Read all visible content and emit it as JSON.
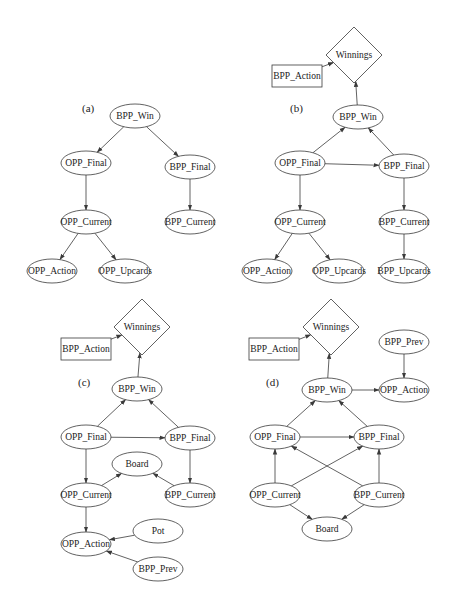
{
  "diagram": {
    "title": "",
    "panels": [
      {
        "label": "(a)",
        "label_pos": [
          82,
          112
        ],
        "nodes": [
          {
            "id": "BPP_Win",
            "label": "BPP_Win",
            "shape": "ellipse",
            "x": 135,
            "y": 116
          },
          {
            "id": "OPP_Final",
            "label": "OPP_Final",
            "shape": "ellipse",
            "x": 86,
            "y": 163
          },
          {
            "id": "BPP_Final",
            "label": "BPP_Final",
            "shape": "ellipse",
            "x": 190,
            "y": 167
          },
          {
            "id": "OPP_Current",
            "label": "OPP_Current",
            "shape": "ellipse",
            "x": 86,
            "y": 222
          },
          {
            "id": "BPP_Current",
            "label": "BPP_Current",
            "shape": "ellipse",
            "x": 190,
            "y": 222
          },
          {
            "id": "OPP_Action",
            "label": "OPP_Action",
            "shape": "ellipse",
            "x": 52,
            "y": 271
          },
          {
            "id": "OPP_Upcards",
            "label": "OPP_Upcards",
            "shape": "ellipse",
            "x": 125,
            "y": 271
          }
        ],
        "edges": [
          [
            "BPP_Win",
            "OPP_Final"
          ],
          [
            "BPP_Win",
            "BPP_Final"
          ],
          [
            "OPP_Final",
            "OPP_Current"
          ],
          [
            "BPP_Final",
            "BPP_Current"
          ],
          [
            "OPP_Current",
            "OPP_Action"
          ],
          [
            "OPP_Current",
            "OPP_Upcards"
          ]
        ]
      },
      {
        "label": "(b)",
        "label_pos": [
          290,
          112
        ],
        "nodes": [
          {
            "id": "Winnings",
            "label": "Winnings",
            "shape": "diamond",
            "x": 354,
            "y": 55
          },
          {
            "id": "BPP_Action",
            "label": "BPP_Action",
            "shape": "rect",
            "x": 297,
            "y": 76
          },
          {
            "id": "BPP_Win",
            "label": "BPP_Win",
            "shape": "ellipse",
            "x": 358,
            "y": 117
          },
          {
            "id": "OPP_Final",
            "label": "OPP_Final",
            "shape": "ellipse",
            "x": 300,
            "y": 163
          },
          {
            "id": "BPP_Final",
            "label": "BPP_Final",
            "shape": "ellipse",
            "x": 404,
            "y": 166
          },
          {
            "id": "OPP_Current",
            "label": "OPP_Current",
            "shape": "ellipse",
            "x": 300,
            "y": 222
          },
          {
            "id": "BPP_Current",
            "label": "BPP_Current",
            "shape": "ellipse",
            "x": 404,
            "y": 222
          },
          {
            "id": "OPP_Action",
            "label": "OPP_Action",
            "shape": "ellipse",
            "x": 267,
            "y": 271
          },
          {
            "id": "OPP_Upcards",
            "label": "OPP_Upcards",
            "shape": "ellipse",
            "x": 339,
            "y": 271
          },
          {
            "id": "BPP_Upcards",
            "label": "BPP_Upcards",
            "shape": "ellipse",
            "x": 404,
            "y": 271
          }
        ],
        "edges": [
          [
            "BPP_Action",
            "Winnings"
          ],
          [
            "BPP_Win",
            "Winnings"
          ],
          [
            "OPP_Final",
            "BPP_Win"
          ],
          [
            "BPP_Final",
            "BPP_Win"
          ],
          [
            "OPP_Final",
            "BPP_Final"
          ],
          [
            "OPP_Final",
            "OPP_Current"
          ],
          [
            "BPP_Final",
            "BPP_Current"
          ],
          [
            "OPP_Current",
            "OPP_Action"
          ],
          [
            "OPP_Current",
            "OPP_Upcards"
          ],
          [
            "BPP_Current",
            "BPP_Upcards"
          ]
        ]
      },
      {
        "label": "(c)",
        "label_pos": [
          78,
          386
        ],
        "nodes": [
          {
            "id": "Winnings",
            "label": "Winnings",
            "shape": "diamond",
            "x": 142,
            "y": 327
          },
          {
            "id": "BPP_Action",
            "label": "BPP_Action",
            "shape": "rect",
            "x": 86,
            "y": 349
          },
          {
            "id": "BPP_Win",
            "label": "BPP_Win",
            "shape": "ellipse",
            "x": 137,
            "y": 389
          },
          {
            "id": "OPP_Final",
            "label": "OPP_Final",
            "shape": "ellipse",
            "x": 86,
            "y": 437
          },
          {
            "id": "BPP_Final",
            "label": "BPP_Final",
            "shape": "ellipse",
            "x": 190,
            "y": 438
          },
          {
            "id": "Board",
            "label": "Board",
            "shape": "ellipse",
            "x": 137,
            "y": 464
          },
          {
            "id": "OPP_Current",
            "label": "OPP_Current",
            "shape": "ellipse",
            "x": 86,
            "y": 495
          },
          {
            "id": "BPP_Current",
            "label": "BPP_Current",
            "shape": "ellipse",
            "x": 190,
            "y": 495
          },
          {
            "id": "OPP_Action",
            "label": "OPP_Action",
            "shape": "ellipse",
            "x": 86,
            "y": 544
          },
          {
            "id": "Pot",
            "label": "Pot",
            "shape": "ellipse",
            "x": 158,
            "y": 531
          },
          {
            "id": "BPP_Prev",
            "label": "BPP_Prev",
            "shape": "ellipse",
            "x": 158,
            "y": 569
          }
        ],
        "edges": [
          [
            "BPP_Action",
            "Winnings"
          ],
          [
            "BPP_Win",
            "Winnings"
          ],
          [
            "OPP_Final",
            "BPP_Win"
          ],
          [
            "BPP_Final",
            "BPP_Win"
          ],
          [
            "OPP_Final",
            "BPP_Final"
          ],
          [
            "OPP_Final",
            "OPP_Current"
          ],
          [
            "BPP_Final",
            "BPP_Current"
          ],
          [
            "OPP_Current",
            "Board"
          ],
          [
            "BPP_Current",
            "Board"
          ],
          [
            "OPP_Current",
            "OPP_Action"
          ],
          [
            "Pot",
            "OPP_Action"
          ],
          [
            "BPP_Prev",
            "OPP_Action"
          ]
        ]
      },
      {
        "label": "(d)",
        "label_pos": [
          266,
          386
        ],
        "nodes": [
          {
            "id": "Winnings",
            "label": "Winnings",
            "shape": "diamond",
            "x": 331,
            "y": 327
          },
          {
            "id": "BPP_Action",
            "label": "BPP_Action",
            "shape": "rect",
            "x": 274,
            "y": 349
          },
          {
            "id": "BPP_Prev",
            "label": "BPP_Prev",
            "shape": "ellipse",
            "x": 404,
            "y": 342
          },
          {
            "id": "BPP_Win",
            "label": "BPP_Win",
            "shape": "ellipse",
            "x": 327,
            "y": 390
          },
          {
            "id": "OPP_Action",
            "label": "OPP_Action",
            "shape": "ellipse",
            "x": 404,
            "y": 390
          },
          {
            "id": "OPP_Final",
            "label": "OPP_Final",
            "shape": "ellipse",
            "x": 275,
            "y": 437
          },
          {
            "id": "BPP_Final",
            "label": "BPP_Final",
            "shape": "ellipse",
            "x": 379,
            "y": 437
          },
          {
            "id": "OPP_Current",
            "label": "OPP_Current",
            "shape": "ellipse",
            "x": 275,
            "y": 495
          },
          {
            "id": "BPP_Current",
            "label": "BPP_Current",
            "shape": "ellipse",
            "x": 379,
            "y": 495
          },
          {
            "id": "Board",
            "label": "Board",
            "shape": "ellipse",
            "x": 327,
            "y": 529
          }
        ],
        "edges": [
          [
            "BPP_Action",
            "Winnings"
          ],
          [
            "BPP_Win",
            "Winnings"
          ],
          [
            "BPP_Prev",
            "OPP_Action"
          ],
          [
            "BPP_Win",
            "OPP_Action"
          ],
          [
            "OPP_Final",
            "BPP_Win"
          ],
          [
            "BPP_Final",
            "BPP_Win"
          ],
          [
            "OPP_Final",
            "BPP_Final"
          ],
          [
            "OPP_Current",
            "OPP_Final"
          ],
          [
            "BPP_Current",
            "BPP_Final"
          ],
          [
            "OPP_Current",
            "BPP_Final"
          ],
          [
            "BPP_Current",
            "OPP_Final"
          ],
          [
            "OPP_Current",
            "Board"
          ],
          [
            "BPP_Current",
            "Board"
          ]
        ]
      }
    ]
  },
  "style": {
    "stroke": "#3a3a3a",
    "fill": "#ffffff",
    "text": "#222222"
  }
}
